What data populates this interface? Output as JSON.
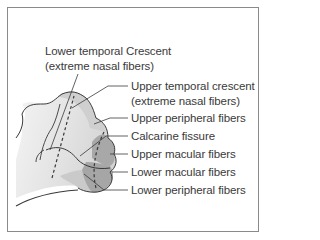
{
  "figure": {
    "labels": {
      "lower_temporal_crescent": {
        "line1": "Lower temporal Crescent",
        "line2": "(extreme nasal fibers)"
      },
      "upper_temporal_crescent": {
        "line1": "Upper temporal crescent",
        "line2": "(extreme nasal fibers)"
      },
      "upper_peripheral": "Upper peripheral fibers",
      "calcarine_fissure": "Calcarine fissure",
      "upper_macular": "Upper macular fibers",
      "lower_macular": "Lower macular fibers",
      "lower_peripheral": "Lower peripheral fibers"
    },
    "colors": {
      "light_region": "#e4e4e4",
      "mid_region": "#c8c8c8",
      "dark_region": "#a9a9a9",
      "outline": "#3a3a3a",
      "frame": "#8a8a8a"
    }
  }
}
